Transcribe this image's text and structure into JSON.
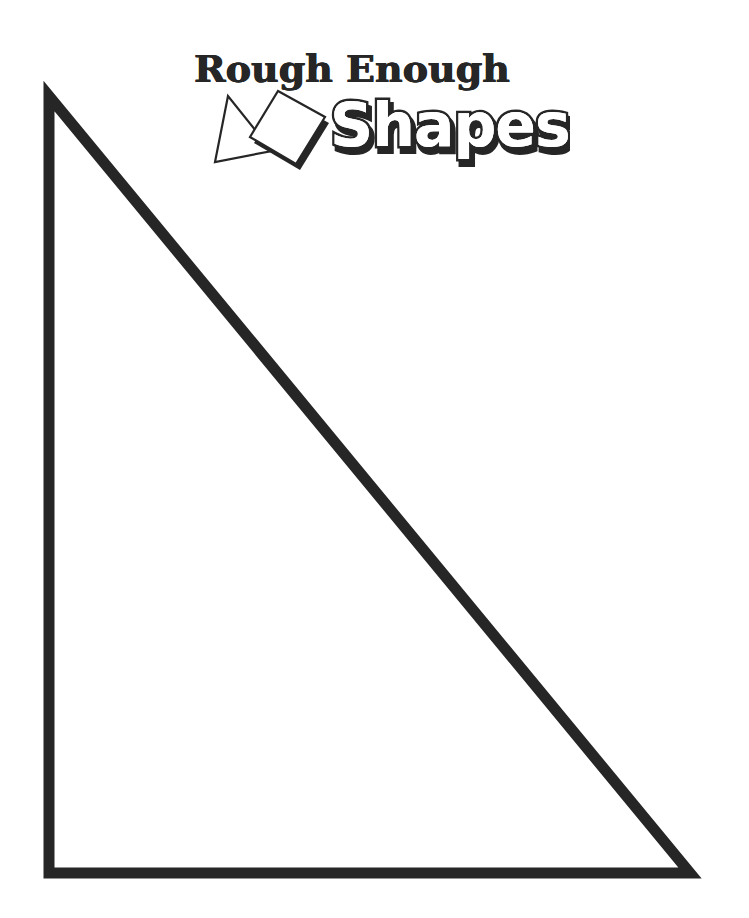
{
  "logo": {
    "line1": "Rough Enough",
    "line2": "Shapes",
    "icons": [
      "triangle-icon",
      "square-icon"
    ]
  },
  "worksheet": {
    "shape": "right-triangle",
    "stroke_color": "#262626",
    "fill_color": "#ffffff",
    "vertices": [
      [
        49,
        96
      ],
      [
        49,
        873
      ],
      [
        690,
        873
      ]
    ]
  }
}
